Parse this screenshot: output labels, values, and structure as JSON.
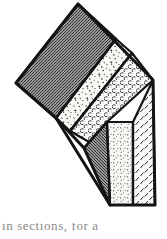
{
  "figure": {
    "kind": "engraved-line-illustration",
    "background_color": "#ffffff",
    "outline_color": "#141414",
    "canvas": {
      "width": 167,
      "height": 239
    },
    "bands": [
      {
        "id": "band-1",
        "label": "dark dense stipple bed",
        "pattern": "dense-dark-stipple",
        "fill_color": "#8d8d8d",
        "points": "78,4 116,39 56,118 16,83"
      },
      {
        "id": "band-2",
        "label": "coarse irregular stipple bed",
        "pattern": "coarse-irregular-stipple",
        "fill_color": "#f7f7f4",
        "points": "116,39 132,53 70,131 56,118"
      },
      {
        "id": "band-3",
        "label": "regular crescent stipple bed",
        "pattern": "crescent-rows",
        "fill_color": "#fbfbf9",
        "points": "132,53 153,80 107,122 89,142 70,131"
      },
      {
        "id": "band-4",
        "label": "dark wedge bed",
        "pattern": "dense-dark-stipple",
        "fill_color": "#8d8d8d",
        "points": "107,122 110,205 84,148"
      },
      {
        "id": "band-5",
        "label": "fine stipple wedge bed",
        "pattern": "fine-stipple",
        "fill_color": "#f7f7f4",
        "points": "107,122 133,122 133,205 110,205"
      },
      {
        "id": "band-6",
        "label": "slanted dash hatch bed",
        "pattern": "slanted-dashes",
        "fill_color": "#fbfbf9",
        "points": "133,122 153,80 155,205 133,205"
      }
    ],
    "bed_dividers": [
      {
        "id": "divider-1-2",
        "from": [
          116,
          39
        ],
        "to": [
          56,
          118
        ]
      },
      {
        "id": "divider-2-3",
        "from": [
          132,
          53
        ],
        "to": [
          70,
          131
        ]
      },
      {
        "id": "divider-3-4",
        "from": [
          107,
          122
        ],
        "to": [
          84,
          148
        ]
      },
      {
        "id": "divider-4-5",
        "from": [
          107,
          122
        ],
        "to": [
          110,
          205
        ]
      },
      {
        "id": "divider-5-6",
        "from": [
          133,
          122
        ],
        "to": [
          133,
          205
        ]
      }
    ],
    "outcrop_outline": "78,4 153,80 155,205 110,205 84,148 56,118 16,83",
    "front_face_edge": {
      "id": "lower-left-face-edge",
      "from": [
        56,
        118
      ],
      "to": [
        110,
        205
      ]
    }
  },
  "caption": {
    "text": "in sections, for a ",
    "state": "clipped-at-page-edge"
  }
}
